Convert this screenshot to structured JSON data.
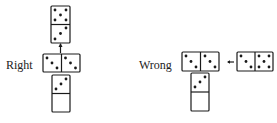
{
  "labels": {
    "right": "Right",
    "wrong": "Wrong"
  },
  "colors": {
    "ink": "#1a1a1a",
    "background": "#ffffff"
  },
  "diagrams": {
    "right": {
      "top_domino": {
        "orientation": "vertical",
        "ends": [
          5,
          3
        ]
      },
      "middle_domino": {
        "orientation": "horizontal",
        "ends": [
          3,
          3
        ],
        "double": true
      },
      "bottom_domino": {
        "orientation": "vertical",
        "ends": [
          3,
          0
        ]
      },
      "connector": "arrow-up-from-double"
    },
    "wrong": {
      "left_domino": {
        "orientation": "horizontal",
        "ends": [
          3,
          3
        ],
        "double": true
      },
      "bottom_domino": {
        "orientation": "vertical",
        "ends": [
          3,
          0
        ]
      },
      "right_domino": {
        "orientation": "horizontal",
        "ends": [
          3,
          5
        ]
      },
      "connector": "arrow-left"
    }
  }
}
